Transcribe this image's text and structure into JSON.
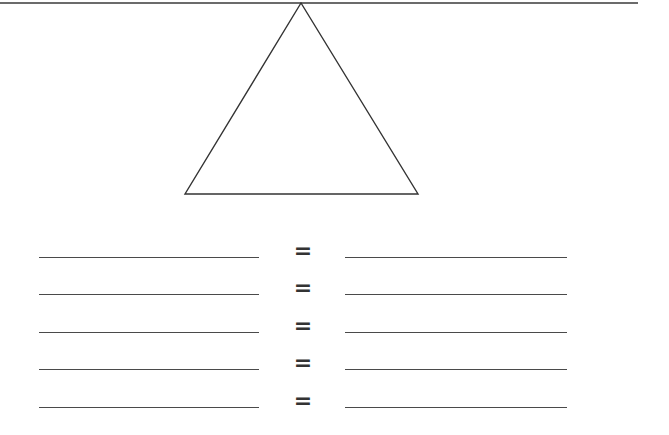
{
  "worksheet": {
    "diagram": {
      "type": "triangle",
      "top_line": {
        "x1": 0,
        "y1": 3,
        "x2": 638,
        "y2": 3
      },
      "apex": [
        301,
        3
      ],
      "base_left": [
        185,
        194
      ],
      "base_right": [
        418,
        194
      ],
      "stroke_color": "#333333"
    },
    "rows": [
      {
        "left_blank": "",
        "operator": "=",
        "right_blank": "",
        "line_y": 257
      },
      {
        "left_blank": "",
        "operator": "=",
        "right_blank": "",
        "line_y": 294
      },
      {
        "left_blank": "",
        "operator": "=",
        "right_blank": "",
        "line_y": 332
      },
      {
        "left_blank": "",
        "operator": "=",
        "right_blank": "",
        "line_y": 369
      },
      {
        "left_blank": "",
        "operator": "=",
        "right_blank": "",
        "line_y": 407
      }
    ]
  }
}
